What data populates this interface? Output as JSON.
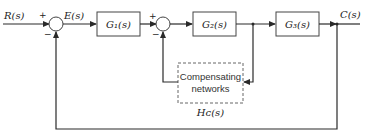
{
  "diagram": {
    "type": "control-system-block-diagram",
    "input_label": "R(s)",
    "error_label": "E(s)",
    "output_label": "C(s)",
    "blocks": [
      {
        "id": "G1",
        "label": "G₁(s)"
      },
      {
        "id": "G2",
        "label": "G₂(s)"
      },
      {
        "id": "G3",
        "label": "G₃(s)"
      }
    ],
    "compensator": {
      "line1": "Compensating",
      "line2": "networks",
      "label": "Hᴄ(s)"
    },
    "junction1": {
      "plus": "+",
      "minus": "−"
    },
    "junction2": {
      "plus": "+",
      "minus": "−"
    },
    "colors": {
      "line": "#2a2a2a",
      "box_border": "#444444",
      "background": "#ffffff"
    }
  }
}
